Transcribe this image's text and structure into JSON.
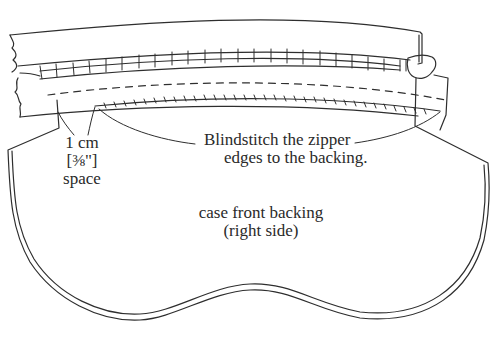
{
  "diagram": {
    "colors": {
      "ink": "#2e2e2e",
      "background": "#ffffff"
    },
    "labels": {
      "space": {
        "lines": [
          "1 cm",
          "[3/8\"]",
          "space"
        ],
        "display": [
          "1 cm",
          "[⅜\"]",
          "space"
        ]
      },
      "instruction": {
        "lines": [
          "Blindstitch the zipper",
          "edges to the backing."
        ]
      },
      "backing": {
        "lines": [
          "case front backing",
          "(right side)"
        ]
      }
    },
    "parts": [
      "zipper-tape-top",
      "zipper-teeth",
      "zipper-pull",
      "zipper-tape-bottom",
      "stitch-line-dashed",
      "blindstitch-line",
      "case-front-backing"
    ]
  }
}
